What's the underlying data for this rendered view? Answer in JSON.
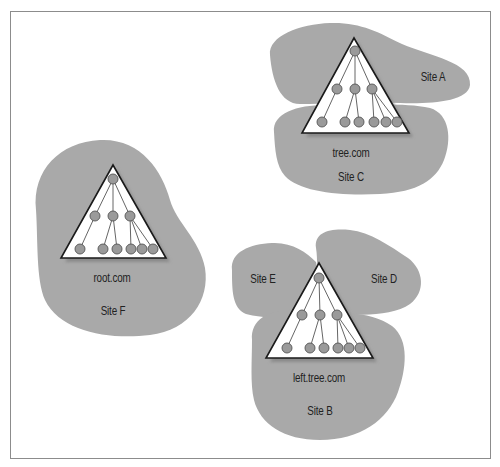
{
  "colors": {
    "blob": "#a9a9a9",
    "triangle_fill": "#ffffff",
    "triangle_stroke": "#1a1a1a",
    "shadow": "#8a8a8a",
    "node_fill": "#9a9a9a",
    "node_stroke": "#555555",
    "edge": "#666666",
    "frame": "#8c8c8c"
  },
  "sites": [
    {
      "id": "A",
      "label": "Site A",
      "x": 433,
      "y": 77
    },
    {
      "id": "C",
      "label": "Site C",
      "x": 351,
      "y": 177
    },
    {
      "id": "F",
      "label": "Site F",
      "x": 113,
      "y": 311
    },
    {
      "id": "E",
      "label": "Site E",
      "x": 263,
      "y": 279
    },
    {
      "id": "D",
      "label": "Site D",
      "x": 384,
      "y": 279
    },
    {
      "id": "B",
      "label": "Site B",
      "x": 320,
      "y": 411
    }
  ],
  "domains": [
    {
      "label": "tree.com",
      "x": 351,
      "y": 153
    },
    {
      "label": "root.com",
      "x": 112,
      "y": 278
    },
    {
      "label": "left.tree.com",
      "x": 319,
      "y": 378
    }
  ],
  "trees": [
    {
      "name": "tree.com",
      "apex": [
        354,
        38
      ],
      "base_left": [
        302,
        133
      ],
      "base_right": [
        409,
        133
      ],
      "root": [
        355,
        51
      ],
      "level2": [
        [
          337,
          89
        ],
        [
          355,
          89
        ],
        [
          372,
          89
        ]
      ],
      "leaves": [
        [
          322,
          122
        ],
        [
          345,
          122
        ],
        [
          359,
          122
        ],
        [
          374,
          122
        ],
        [
          386,
          122
        ],
        [
          397,
          122
        ]
      ]
    },
    {
      "name": "root.com",
      "apex": [
        113,
        165
      ],
      "base_left": [
        61,
        258
      ],
      "base_right": [
        166,
        258
      ],
      "root": [
        113,
        179
      ],
      "level2": [
        [
          95,
          216
        ],
        [
          113,
          216
        ],
        [
          130,
          216
        ]
      ],
      "leaves": [
        [
          80,
          249
        ],
        [
          103,
          249
        ],
        [
          117,
          249
        ],
        [
          131,
          249
        ],
        [
          142,
          249
        ],
        [
          153,
          249
        ]
      ]
    },
    {
      "name": "left.tree.com",
      "apex": [
        319,
        263
      ],
      "base_left": [
        266,
        358
      ],
      "base_right": [
        373,
        358
      ],
      "root": [
        319,
        278
      ],
      "level2": [
        [
          302,
          315
        ],
        [
          320,
          315
        ],
        [
          337,
          315
        ]
      ],
      "leaves": [
        [
          287,
          348
        ],
        [
          310,
          348
        ],
        [
          324,
          348
        ],
        [
          338,
          348
        ],
        [
          349,
          348
        ],
        [
          360,
          348
        ]
      ]
    }
  ]
}
